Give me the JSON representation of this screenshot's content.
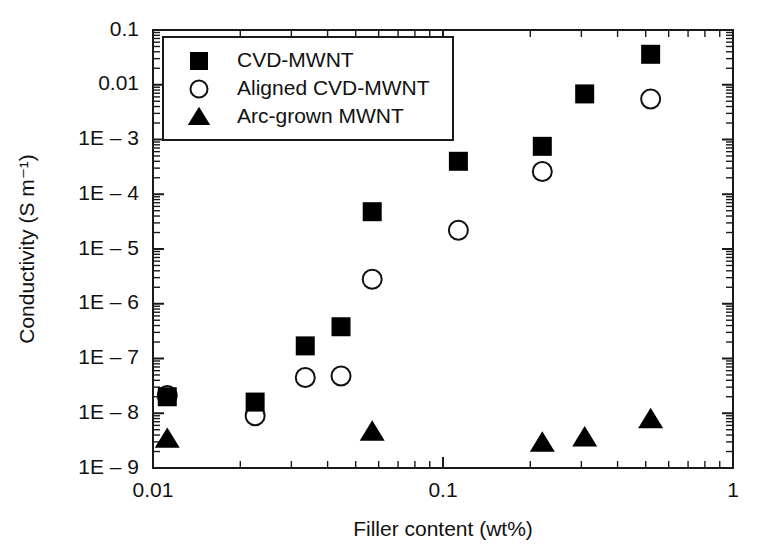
{
  "chart_data": {
    "type": "scatter",
    "title": "",
    "xlabel": "Filler content (wt%)",
    "ylabel": "Conductivity (S m⁻¹)",
    "xscale": "log",
    "yscale": "log",
    "xlim": [
      0.01,
      1
    ],
    "ylim": [
      1e-09,
      0.1
    ],
    "grid": false,
    "legend_position": "top-left",
    "x_tick_labels": [
      "0.01",
      "0.1",
      "1"
    ],
    "x_tick_values": [
      0.01,
      0.1,
      1
    ],
    "y_tick_labels": [
      "0.1",
      "0.01",
      "1E – 3",
      "1E – 4",
      "1E – 5",
      "1E – 6",
      "1E – 7",
      "1E – 8",
      "1E – 9"
    ],
    "y_tick_values": [
      0.1,
      0.01,
      0.001,
      0.0001,
      1e-05,
      1e-06,
      1e-07,
      1e-08,
      1e-09
    ],
    "series": [
      {
        "name": "CVD-MWNT",
        "marker": "filled-square",
        "color": "#000000",
        "points": [
          {
            "x": 0.0112,
            "y": 2e-08
          },
          {
            "x": 0.0225,
            "y": 1.6e-08
          },
          {
            "x": 0.0335,
            "y": 1.7e-07
          },
          {
            "x": 0.0445,
            "y": 3.8e-07
          },
          {
            "x": 0.057,
            "y": 4.8e-05
          },
          {
            "x": 0.113,
            "y": 0.0004
          },
          {
            "x": 0.22,
            "y": 0.00075
          },
          {
            "x": 0.308,
            "y": 0.0068
          },
          {
            "x": 0.52,
            "y": 0.036
          }
        ]
      },
      {
        "name": "Aligned CVD-MWNT",
        "marker": "open-circle",
        "color": "#000000",
        "points": [
          {
            "x": 0.0112,
            "y": 2.1e-08
          },
          {
            "x": 0.0225,
            "y": 9e-09
          },
          {
            "x": 0.0335,
            "y": 4.5e-08
          },
          {
            "x": 0.0445,
            "y": 4.8e-08
          },
          {
            "x": 0.057,
            "y": 2.8e-06
          },
          {
            "x": 0.113,
            "y": 2.2e-05
          },
          {
            "x": 0.22,
            "y": 0.00026
          },
          {
            "x": 0.52,
            "y": 0.0055
          }
        ]
      },
      {
        "name": "Arc-grown MWNT",
        "marker": "filled-triangle",
        "color": "#000000",
        "points": [
          {
            "x": 0.0112,
            "y": 3.4e-09
          },
          {
            "x": 0.057,
            "y": 4.6e-09
          },
          {
            "x": 0.22,
            "y": 2.9e-09
          },
          {
            "x": 0.308,
            "y": 3.6e-09
          },
          {
            "x": 0.52,
            "y": 7.8e-09
          }
        ]
      }
    ]
  },
  "legend": {
    "entries": [
      {
        "label": "CVD-MWNT",
        "marker": "filled-square"
      },
      {
        "label": "Aligned CVD-MWNT",
        "marker": "open-circle"
      },
      {
        "label": "Arc-grown MWNT",
        "marker": "filled-triangle"
      }
    ]
  }
}
